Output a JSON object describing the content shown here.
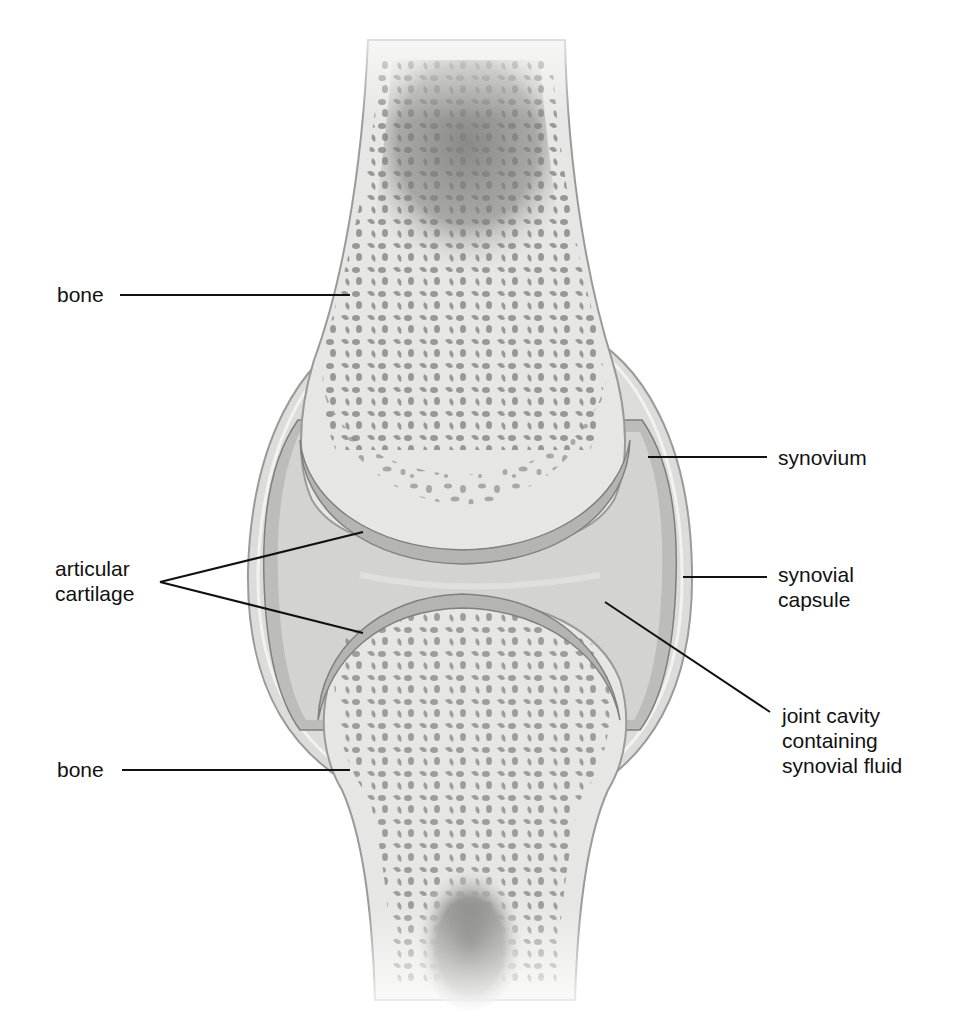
{
  "figure": {
    "colors": {
      "bone": "#e6e6e4",
      "bone_edge": "#9a9a98",
      "spongy_holes": "#8e8e8c",
      "marrow": "#7a7a78",
      "cartilage": "#b4b4b2",
      "cartilage_edge": "#808080",
      "cavity": "#d3d3d1",
      "synovium": "#bcbcba",
      "capsule": "#dcdcda",
      "leader_line": "#111111"
    }
  },
  "labels": {
    "bone_top": {
      "text": "bone"
    },
    "articular_cartilage": {
      "line1": "articular",
      "line2": "cartilage"
    },
    "bone_bottom": {
      "text": "bone"
    },
    "synovium": {
      "text": "synovium"
    },
    "synovial_capsule": {
      "line1": "synovial",
      "line2": "capsule"
    },
    "joint_cavity": {
      "line1": "joint cavity",
      "line2": "containing",
      "line3": "synovial fluid"
    }
  }
}
